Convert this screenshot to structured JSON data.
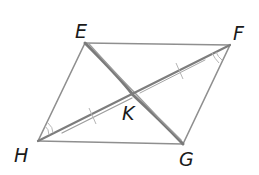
{
  "diagram": {
    "type": "geometry",
    "shape": "parallelogram",
    "vertices": [
      {
        "id": "E",
        "label": "E",
        "x": 85,
        "y": 43
      },
      {
        "id": "F",
        "label": "F",
        "x": 230,
        "y": 45
      },
      {
        "id": "G",
        "label": "G",
        "x": 183,
        "y": 144
      },
      {
        "id": "H",
        "label": "H",
        "x": 38,
        "y": 141
      }
    ],
    "intersection": {
      "id": "K",
      "label": "K",
      "x": 133,
      "y": 95
    },
    "sides": [
      "EF",
      "FG",
      "GH",
      "HE"
    ],
    "diagonals": [
      {
        "from": "E",
        "to": "G",
        "emphasis": "thick"
      },
      {
        "from": "H",
        "to": "F",
        "emphasis": "medium"
      }
    ],
    "tick_marks": {
      "HK": 1,
      "KF": 1
    },
    "angle_marks": [
      {
        "at": "H",
        "between": [
          "HE",
          "HF"
        ],
        "arcs": 2
      },
      {
        "at": "F",
        "between": [
          "FG",
          "FH"
        ],
        "arcs": 2
      }
    ],
    "colors": {
      "line": "#8a8a8a",
      "diagonal": "#6e6e6e",
      "label": "#1a1a1a",
      "background": "#ffffff"
    }
  }
}
